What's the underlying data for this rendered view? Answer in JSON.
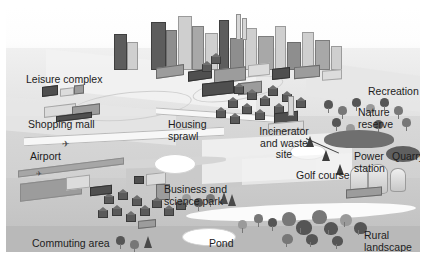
{
  "figure": {
    "type": "isometric landscape illustration",
    "palette": {
      "background": "#ffffff",
      "sky": "#fdfdfd",
      "upper_slope": "#e4e4e4",
      "mid_slope": "#d4d4d4",
      "low_plain": "#c6c6c6",
      "foot": "#b9b9b9",
      "label_text": "#1d1d1d",
      "dark_building": "#4f4f4f",
      "mid_building": "#9c9c9c",
      "light_building": "#dcdcdc"
    }
  },
  "labels": [
    {
      "id": "leisure-complex",
      "text": "Leisure complex",
      "x": 20,
      "y": 66,
      "align": "left"
    },
    {
      "id": "shopping-mall",
      "text": "Shopping mall",
      "x": 22,
      "y": 111,
      "align": "left"
    },
    {
      "id": "airport",
      "text": "Airport",
      "x": 24,
      "y": 143,
      "align": "left"
    },
    {
      "id": "commuting-area",
      "text": "Commuting area",
      "x": 26,
      "y": 230,
      "align": "left"
    },
    {
      "id": "housing-sprawl",
      "text": "Housing\nsprawl",
      "x": 162,
      "y": 111,
      "align": "left"
    },
    {
      "id": "business-science-park",
      "text": "Business and\nscience park",
      "x": 158,
      "y": 176,
      "align": "left"
    },
    {
      "id": "pond",
      "text": "Pond",
      "x": 203,
      "y": 230,
      "align": "left"
    },
    {
      "id": "incinerator-waste-site",
      "text": "Incinerator\nand waste\nsite",
      "x": 278,
      "y": 118,
      "align": "center"
    },
    {
      "id": "golf-course",
      "text": "Golf course",
      "x": 290,
      "y": 162,
      "align": "left"
    },
    {
      "id": "recreation",
      "text": "Recreation",
      "x": 368,
      "y": 78,
      "align": "left"
    },
    {
      "id": "nature-reserve",
      "text": "Nature\nreserve",
      "x": 352,
      "y": 99,
      "align": "left"
    },
    {
      "id": "power-station",
      "text": "Power\nstation",
      "x": 352,
      "y": 143,
      "align": "left"
    },
    {
      "id": "quarry",
      "text": "Quarry",
      "x": 386,
      "y": 143,
      "align": "left"
    },
    {
      "id": "rural-landscape",
      "text": "Rural\nlandscape",
      "x": 374,
      "y": 222,
      "align": "left"
    }
  ]
}
